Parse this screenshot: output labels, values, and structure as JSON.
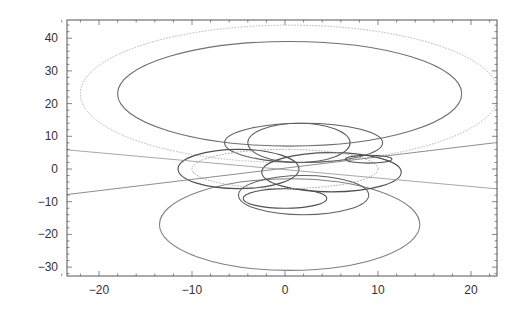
{
  "chart_data": {
    "type": "line",
    "title": "",
    "xlabel": "",
    "ylabel": "",
    "xlim": [
      -24,
      22.5
    ],
    "ylim": [
      -33.5,
      45
    ],
    "grid": false,
    "legend": null,
    "x_ticks": [
      -20,
      -10,
      0,
      10,
      20
    ],
    "x_tick_labels": [
      "−20",
      "−10",
      "0",
      "10",
      "20"
    ],
    "y_ticks": [
      -30,
      -20,
      -10,
      0,
      10,
      20,
      30,
      40
    ],
    "y_tick_labels": [
      "−30",
      "−20",
      "−10",
      "0",
      "10",
      "20",
      "30",
      "40"
    ],
    "series": [
      {
        "name": "outer upper orbit (light dotted)",
        "shape": "ellipse",
        "cx": 0.5,
        "cy": 23,
        "rx": 22.5,
        "ry": 21,
        "style": "dotted",
        "color": "#b0b0b0"
      },
      {
        "name": "inner upper orbit",
        "shape": "ellipse",
        "cx": 0.5,
        "cy": 23,
        "rx": 18.5,
        "ry": 16,
        "style": "solid",
        "color": "#707070"
      },
      {
        "name": "lower orbit",
        "shape": "ellipse",
        "cx": 0.5,
        "cy": -17,
        "rx": 14,
        "ry": 14,
        "style": "solid",
        "color": "#808080"
      },
      {
        "name": "central left loop",
        "shape": "ellipse",
        "cx": -5,
        "cy": 0,
        "rx": 6.5,
        "ry": 6,
        "style": "solid",
        "color": "#505050"
      },
      {
        "name": "central right loop",
        "shape": "ellipse",
        "cx": 5,
        "cy": -1,
        "rx": 7.5,
        "ry": 6,
        "style": "solid",
        "color": "#505050"
      },
      {
        "name": "upper small loop",
        "shape": "ellipse",
        "cx": 1.5,
        "cy": 8,
        "rx": 5.5,
        "ry": 6,
        "style": "solid",
        "color": "#606060"
      },
      {
        "name": "upper wide loop",
        "shape": "ellipse",
        "cx": 2,
        "cy": 8,
        "rx": 8.5,
        "ry": 6,
        "style": "solid",
        "color": "#606060"
      },
      {
        "name": "lower small loop",
        "shape": "ellipse",
        "cx": 0,
        "cy": -9,
        "rx": 4.5,
        "ry": 3,
        "style": "solid",
        "color": "#505050"
      },
      {
        "name": "lower medium loop",
        "shape": "ellipse",
        "cx": 2,
        "cy": -8,
        "rx": 7,
        "ry": 6,
        "style": "solid",
        "color": "#606060"
      },
      {
        "name": "central dotted loop",
        "shape": "ellipse",
        "cx": 0,
        "cy": 0,
        "rx": 10,
        "ry": 6,
        "style": "dotted",
        "color": "#a0a0a0"
      },
      {
        "name": "right small loop",
        "shape": "ellipse",
        "cx": 9,
        "cy": 3,
        "rx": 2.5,
        "ry": 1.2,
        "style": "solid",
        "color": "#505050"
      }
    ],
    "lines": [
      {
        "name": "crossing line 1",
        "x": [
          -24,
          22.5
        ],
        "y": [
          -8,
          8
        ],
        "color": "#707070"
      },
      {
        "name": "crossing line 2",
        "x": [
          -24,
          22.5
        ],
        "y": [
          6,
          -6
        ],
        "color": "#909090"
      }
    ]
  }
}
